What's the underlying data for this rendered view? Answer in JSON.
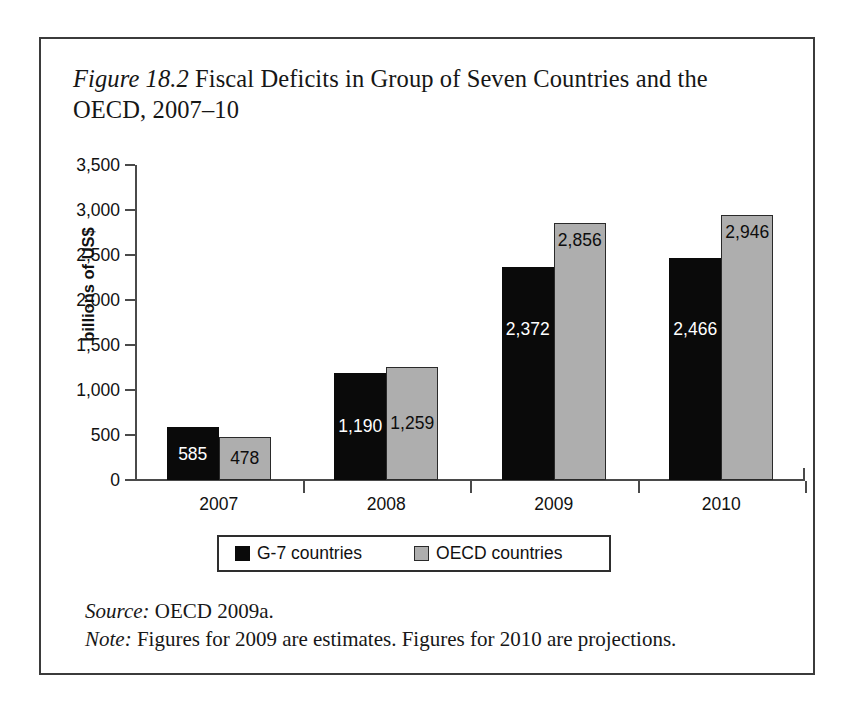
{
  "figure": {
    "label": "Figure 18.2",
    "title_rest": " Fiscal Deficits in Group of Seven Countries and the OECD, 2007–10",
    "source_lead": "Source:",
    "source_text": " OECD 2009a.",
    "note_lead": "Note:",
    "note_text": " Figures for 2009 are estimates. Figures for 2010 are projections."
  },
  "chart_data": {
    "type": "bar",
    "title": "Figure 18.2 Fiscal Deficits in Group of Seven Countries and the OECD, 2007–10",
    "xlabel": "",
    "ylabel": "billions of US$",
    "categories": [
      "2007",
      "2008",
      "2009",
      "2010"
    ],
    "series": [
      {
        "name": "G-7 countries",
        "color": "#0a0a0a",
        "values": [
          585,
          1190,
          2372,
          2466
        ],
        "labels": [
          "585",
          "1,190",
          "2,372",
          "2,466"
        ]
      },
      {
        "name": "OECD countries",
        "color": "#aeaeae",
        "values": [
          478,
          1259,
          2856,
          2946
        ],
        "labels": [
          "478",
          "1,259",
          "2,856",
          "2,946"
        ]
      }
    ],
    "ylim": [
      0,
      3500
    ],
    "yticks": [
      0,
      500,
      1000,
      1500,
      2000,
      2500,
      3000,
      3500
    ],
    "ytick_labels": [
      "0",
      "500",
      "1,000",
      "1,500",
      "2,000",
      "2,500",
      "3,000",
      "3,500"
    ],
    "grid": false,
    "legend_position": "bottom-center",
    "legend": [
      "G-7 countries",
      "OECD countries"
    ]
  },
  "legend": {
    "g7_label": "G-7 countries",
    "oecd_label": "OECD countries"
  }
}
